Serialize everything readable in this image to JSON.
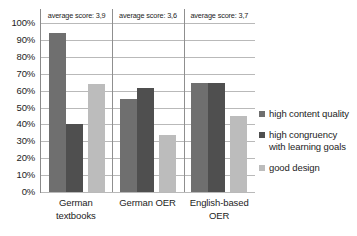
{
  "chart_data": {
    "type": "bar",
    "title": "",
    "subtitle": "",
    "xlabel": "",
    "ylabel": "",
    "ylim": [
      0,
      100
    ],
    "grid": true,
    "legend_position": "right",
    "categories": [
      "German textbooks",
      "German OER",
      "English-based OER"
    ],
    "ytick_labels": [
      "100%",
      "90%",
      "80%",
      "70%",
      "60%",
      "50%",
      "40%",
      "30%",
      "20%",
      "10%",
      "0%"
    ],
    "ytick_values": [
      100,
      90,
      80,
      70,
      60,
      50,
      40,
      30,
      20,
      10,
      0
    ],
    "series": [
      {
        "name": "high content quality",
        "color": "#6f6f6f",
        "values": [
          94,
          55,
          64.5
        ]
      },
      {
        "name": "high congruency with learning goals",
        "color": "#4f4f4f",
        "values": [
          40.5,
          61.5,
          64.5
        ]
      },
      {
        "name": "good design",
        "color": "#bcbcbc",
        "values": [
          64,
          34,
          45
        ]
      }
    ],
    "annotations": [
      "average score: 3,9",
      "average score: 3,6",
      "average score: 3,7"
    ]
  },
  "legend": {
    "entries": [
      {
        "label": "high content quality",
        "color": "#6f6f6f"
      },
      {
        "label": "high congruency with learning goals",
        "color": "#4f4f4f"
      },
      {
        "label": "good design",
        "color": "#bcbcbc"
      }
    ]
  }
}
